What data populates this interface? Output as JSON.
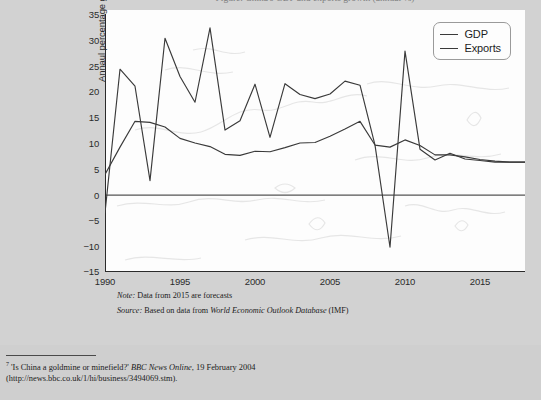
{
  "figure": {
    "title_partial": "Figure: China's GDP and exports growth (annual %)",
    "note": "Note: Data from 2015 are forecasts",
    "note_prefix": "Note:",
    "note_body": "Data from 2015 are forecasts",
    "source_prefix": "Source:",
    "source_body_pre": "Based on data from",
    "source_italic": "World Economic Outlook Database",
    "source_body_post": "(IMF)"
  },
  "legend": {
    "position": "top-right",
    "items": [
      {
        "label": "GDP",
        "color": "#3a3a3a"
      },
      {
        "label": "Exports",
        "color": "#3a3a3a"
      }
    ]
  },
  "axes": {
    "ylabel": "Annaul percentage growth",
    "xlabel": "",
    "ytick_labels": [
      "35",
      "30",
      "25",
      "20",
      "15",
      "10",
      "5",
      "0",
      "−5",
      "−10",
      "−15"
    ],
    "xtick_labels": [
      "1990",
      "1995",
      "2000",
      "2005",
      "2010",
      "2015"
    ],
    "ylim": [
      -15,
      35
    ],
    "xlim": [
      1990,
      2018
    ],
    "ytick_step": 5,
    "xtick_step_minor": 1,
    "xtick_step_major": 5,
    "grid": false,
    "zero_line": true
  },
  "footnote": {
    "marker": "7",
    "line1_quote": "'Is China a goldmine or minefield?'",
    "line1_italic": "BBC News Online",
    "line1_rest": ", 19 February 2004",
    "line2": "(http://news.bbc.co.uk/1/hi/business/3494069.stm)."
  },
  "colors": {
    "page_background": "#cfcfcf",
    "paper": "#d2d2d2",
    "figure_background": "#fdfdfd",
    "line": "#3a3a3a",
    "axis": "#2b2b2b",
    "map_watermark": "#e6e6e6",
    "text": "#1b1b1b"
  },
  "chart_data": {
    "type": "line",
    "title": "China's GDP and exports growth",
    "xlabel": "",
    "ylabel": "Annaul percentage growth",
    "xlim": [
      1990,
      2018
    ],
    "ylim": [
      -15,
      35
    ],
    "grid": false,
    "legend_position": "top-right",
    "x": [
      1990,
      1991,
      1992,
      1993,
      1994,
      1995,
      1996,
      1997,
      1998,
      1999,
      2000,
      2001,
      2002,
      2003,
      2004,
      2005,
      2006,
      2007,
      2008,
      2009,
      2010,
      2011,
      2012,
      2013,
      2014,
      2015,
      2016,
      2017,
      2018
    ],
    "series": [
      {
        "name": "GDP",
        "values": [
          3.9,
          9.2,
          14.2,
          14.0,
          13.1,
          10.9,
          10.0,
          9.3,
          7.8,
          7.6,
          8.4,
          8.3,
          9.1,
          10.0,
          10.1,
          11.3,
          12.7,
          14.2,
          9.6,
          9.2,
          10.6,
          9.5,
          7.7,
          7.7,
          7.3,
          6.8,
          6.5,
          6.3,
          6.3
        ]
      },
      {
        "name": "Exports",
        "values": [
          -3.5,
          24.3,
          21.0,
          2.7,
          30.3,
          22.9,
          17.9,
          32.3,
          12.5,
          14.3,
          21.4,
          11.1,
          21.5,
          19.4,
          18.6,
          19.5,
          22.0,
          21.2,
          9.6,
          -10.2,
          27.8,
          8.8,
          6.7,
          8.0,
          6.9,
          6.6,
          6.3,
          6.3,
          6.3
        ]
      }
    ]
  }
}
